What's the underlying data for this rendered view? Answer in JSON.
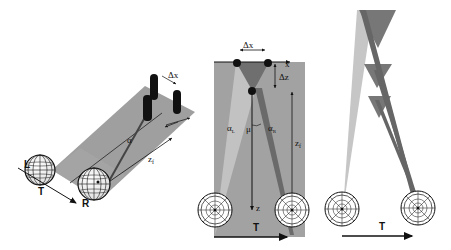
{
  "panel_left": {
    "labels": {
      "left_eye": "L",
      "right_eye": "R",
      "translation": "T",
      "delta_x": "Δx",
      "delta_z": "Δz",
      "fixation_distance": "z",
      "fixation_subscript": "f",
      "alpha_l": "α",
      "alpha_r": "α"
    }
  },
  "panel_middle": {
    "labels": {
      "delta_x": "Δx",
      "delta_z": "Δz",
      "x_axis": "x",
      "z_axis": "z",
      "fixation_distance": "z",
      "fixation_subscript": "f",
      "alpha_l": "α",
      "alpha_l_sub": "L",
      "alpha_r": "α",
      "alpha_r_sub": "R",
      "mu": "μ",
      "translation": "T"
    }
  },
  "panel_right": {
    "labels": {
      "translation": "T"
    }
  },
  "colors": {
    "plane_gray": "#9a9a9a",
    "light_wedge": "#c4c4c4",
    "dark_wedge": "#6e6e6e",
    "ink": "#111111"
  }
}
